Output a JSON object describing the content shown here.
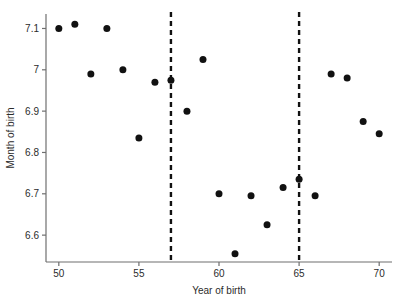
{
  "chart_data": {
    "type": "scatter",
    "title": "",
    "xlabel": "Year of birth",
    "ylabel": "Month of birth",
    "xlim": [
      49.2,
      70.8
    ],
    "ylim": [
      6.535,
      7.135
    ],
    "grid": false,
    "legend": null,
    "xticks": [
      50,
      55,
      60,
      65,
      70
    ],
    "xtick_labels": [
      "50",
      "55",
      "60",
      "65",
      "70"
    ],
    "yticks": [
      6.6,
      6.7,
      6.8,
      6.9,
      7.0,
      7.1
    ],
    "ytick_labels": [
      "6.6",
      "6.7",
      "6.8",
      "6.9",
      "7",
      "7.1"
    ],
    "x": [
      50,
      51,
      53,
      52,
      54,
      55,
      56,
      57,
      58,
      59,
      60,
      61,
      62,
      63,
      64,
      65,
      66,
      67,
      68,
      69,
      70
    ],
    "y": [
      7.1,
      7.11,
      7.1,
      6.99,
      7.0,
      6.835,
      6.97,
      6.975,
      6.9,
      7.025,
      6.7,
      6.555,
      6.695,
      6.625,
      6.715,
      6.735,
      6.695,
      6.99,
      6.98,
      6.875,
      6.845
    ],
    "points": [
      {
        "x": 50,
        "y": 7.1
      },
      {
        "x": 51,
        "y": 7.11
      },
      {
        "x": 52,
        "y": 6.99
      },
      {
        "x": 53,
        "y": 7.1
      },
      {
        "x": 54,
        "y": 7.0
      },
      {
        "x": 55,
        "y": 6.835
      },
      {
        "x": 56,
        "y": 6.97
      },
      {
        "x": 57,
        "y": 6.975
      },
      {
        "x": 58,
        "y": 6.9
      },
      {
        "x": 59,
        "y": 7.025
      },
      {
        "x": 60,
        "y": 6.7
      },
      {
        "x": 61,
        "y": 6.555
      },
      {
        "x": 62,
        "y": 6.695
      },
      {
        "x": 63,
        "y": 6.625
      },
      {
        "x": 64,
        "y": 6.715
      },
      {
        "x": 65,
        "y": 6.735
      },
      {
        "x": 66,
        "y": 6.695
      },
      {
        "x": 67,
        "y": 6.99
      },
      {
        "x": 68,
        "y": 6.98
      },
      {
        "x": 69,
        "y": 6.875
      },
      {
        "x": 70,
        "y": 6.845
      }
    ],
    "annotations": [
      {
        "type": "vline",
        "x": 57,
        "style": "dashed",
        "label": "cutoff-57"
      },
      {
        "type": "vline",
        "x": 65,
        "style": "dashed",
        "label": "cutoff-65"
      }
    ]
  }
}
